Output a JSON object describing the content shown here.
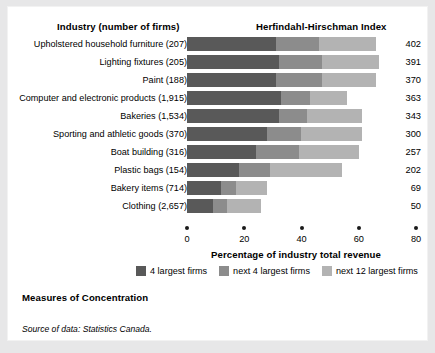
{
  "headers": {
    "industry": "Industry (number of firms)",
    "hhi": "Herfindahl-Hirschman Index"
  },
  "footer": {
    "measures": "Measures of Concentration",
    "source": "Source of data: Statistics Canada."
  },
  "colors": {
    "seg_4_largest": "#595959",
    "seg_next_4": "#8c8c8c",
    "seg_next_12": "#b3b3b3",
    "panel": "#ffffff",
    "page": "#e7e7e8",
    "tick": "#1a1a1a"
  },
  "legend": [
    {
      "label": "4 largest firms",
      "color": "#595959",
      "swatch": "legend-swatch-4-largest"
    },
    {
      "label": "next 4 largest firms",
      "color": "#8c8c8c",
      "swatch": "legend-swatch-next-4"
    },
    {
      "label": "next 12 largest firms",
      "color": "#b3b3b3",
      "swatch": "legend-swatch-next-12"
    }
  ],
  "chart_data": {
    "type": "bar",
    "orientation": "horizontal",
    "stacked": true,
    "title": "Measures of Concentration",
    "xlabel": "Percentage of industry total revenue",
    "ylabel": "Industry (number of firms)",
    "xlim": [
      0,
      80
    ],
    "xticks": [
      0,
      20,
      40,
      60,
      80
    ],
    "xtick_labels": [
      "0",
      "20",
      "40",
      "60",
      "80"
    ],
    "grid": false,
    "legend_position": "bottom",
    "value_column_header": "Herfindahl-Hirschman Index",
    "categories": [
      "Upholstered household furniture (207)",
      "Lighting fixtures (205)",
      "Paint (188)",
      "Computer and electronic products (1,915)",
      "Bakeries (1,534)",
      "Sporting and athletic goods (370)",
      "Boat building (316)",
      "Plastic bags (154)",
      "Bakery items (714)",
      "Clothing (2,657)"
    ],
    "series": [
      {
        "name": "4 largest firms",
        "color": "#595959",
        "values": [
          31,
          32,
          31,
          33,
          32,
          28,
          24,
          18,
          12,
          9
        ]
      },
      {
        "name": "next 4 largest firms",
        "color": "#8c8c8c",
        "values": [
          15,
          15,
          16,
          10,
          10,
          12,
          15,
          11,
          5,
          5
        ]
      },
      {
        "name": "next 12 largest firms",
        "color": "#b3b3b3",
        "values": [
          20,
          20,
          19,
          13,
          19,
          21,
          21,
          25,
          11,
          12
        ]
      }
    ],
    "hhi_values": [
      402,
      391,
      370,
      363,
      343,
      300,
      257,
      202,
      69,
      50
    ],
    "rows": [
      {
        "label": "Upholstered household furniture (207)",
        "s1": 31,
        "s2": 15,
        "s3": 20,
        "hhi": 402
      },
      {
        "label": "Lighting fixtures (205)",
        "s1": 32,
        "s2": 15,
        "s3": 20,
        "hhi": 391
      },
      {
        "label": "Paint (188)",
        "s1": 31,
        "s2": 16,
        "s3": 19,
        "hhi": 370
      },
      {
        "label": "Computer and electronic products (1,915)",
        "s1": 33,
        "s2": 10,
        "s3": 13,
        "hhi": 363
      },
      {
        "label": "Bakeries (1,534)",
        "s1": 32,
        "s2": 10,
        "s3": 19,
        "hhi": 343
      },
      {
        "label": "Sporting and athletic goods (370)",
        "s1": 28,
        "s2": 12,
        "s3": 21,
        "hhi": 300
      },
      {
        "label": "Boat building (316)",
        "s1": 24,
        "s2": 15,
        "s3": 21,
        "hhi": 257
      },
      {
        "label": "Plastic bags (154)",
        "s1": 18,
        "s2": 11,
        "s3": 25,
        "hhi": 202
      },
      {
        "label": "Bakery items (714)",
        "s1": 12,
        "s2": 5,
        "s3": 11,
        "hhi": 69
      },
      {
        "label": "Clothing (2,657)",
        "s1": 9,
        "s2": 5,
        "s3": 12,
        "hhi": 50
      }
    ]
  }
}
